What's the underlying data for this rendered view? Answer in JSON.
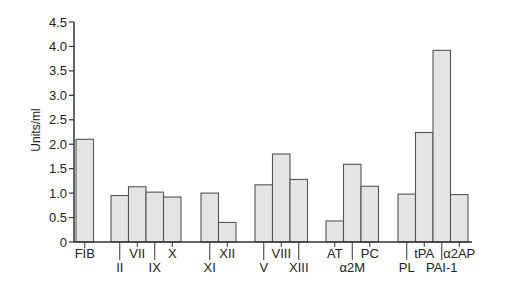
{
  "chart_data": {
    "type": "bar",
    "title": "",
    "xlabel": "",
    "ylabel": "Units/ml",
    "ylim": [
      0,
      4.5
    ],
    "yticks": [
      "0",
      "0.5",
      "1.0",
      "1.5",
      "2.0",
      "2.5",
      "3.0",
      "3.5",
      "4.0",
      "4.5"
    ],
    "grid": false,
    "legend": null,
    "groups": [
      {
        "bars": [
          {
            "label": "FIB",
            "value": 2.1,
            "row": 0
          }
        ]
      },
      {
        "bars": [
          {
            "label": "II",
            "value": 0.95,
            "row": 1
          },
          {
            "label": "VII",
            "value": 1.13,
            "row": 0
          },
          {
            "label": "IX",
            "value": 1.02,
            "row": 1
          },
          {
            "label": "X",
            "value": 0.92,
            "row": 0
          }
        ]
      },
      {
        "bars": [
          {
            "label": "XI",
            "value": 1.0,
            "row": 1
          },
          {
            "label": "XII",
            "value": 0.4,
            "row": 0
          }
        ]
      },
      {
        "bars": [
          {
            "label": "V",
            "value": 1.17,
            "row": 1
          },
          {
            "label": "VIII",
            "value": 1.8,
            "row": 0
          },
          {
            "label": "XIII",
            "value": 1.28,
            "row": 1
          }
        ]
      },
      {
        "bars": [
          {
            "label": "AT",
            "value": 0.43,
            "row": 0
          },
          {
            "label": "α2M",
            "value": 1.59,
            "row": 1
          },
          {
            "label": "PC",
            "value": 1.14,
            "row": 0
          }
        ]
      },
      {
        "bars": [
          {
            "label": "PL",
            "value": 0.98,
            "row": 1
          },
          {
            "label": "tPA",
            "value": 2.24,
            "row": 0
          },
          {
            "label": "PAI-1",
            "value": 3.92,
            "row": 1
          },
          {
            "label": "α2AP",
            "value": 0.97,
            "row": 0
          }
        ]
      }
    ],
    "categories": [
      "FIB",
      "II",
      "VII",
      "IX",
      "X",
      "XI",
      "XII",
      "V",
      "VIII",
      "XIII",
      "AT",
      "α2M",
      "PC",
      "PL",
      "tPA",
      "PAI-1",
      "α2AP"
    ],
    "values": [
      2.1,
      0.95,
      1.13,
      1.02,
      0.92,
      1.0,
      0.4,
      1.17,
      1.8,
      1.28,
      0.43,
      1.59,
      1.14,
      0.98,
      2.24,
      3.92,
      0.97
    ],
    "colors": {
      "bar_fill": "#e4e4e4",
      "bar_stroke": "#555555",
      "axis": "#333333"
    }
  }
}
